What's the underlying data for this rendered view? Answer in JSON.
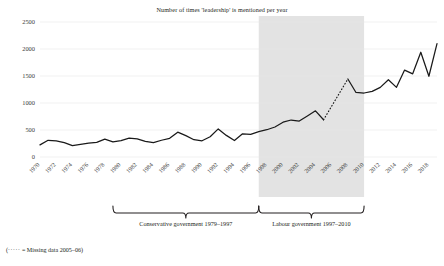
{
  "chart_data": {
    "type": "line",
    "title": "Number of times 'leadership' is mentioned per year",
    "xlabel": "",
    "ylabel": "",
    "ylim": [
      0,
      2500
    ],
    "yticks": [
      0,
      500,
      1000,
      1500,
      2000,
      2500
    ],
    "xlim": [
      1970,
      2019
    ],
    "xticks": [
      1970,
      1972,
      1974,
      1976,
      1978,
      1980,
      1982,
      1984,
      1986,
      1988,
      1990,
      1992,
      1994,
      1996,
      1998,
      2000,
      2002,
      2004,
      2006,
      2008,
      2010,
      2012,
      2014,
      2016,
      2018
    ],
    "grid": true,
    "legend": "none",
    "x": [
      1970,
      1971,
      1972,
      1973,
      1974,
      1975,
      1976,
      1977,
      1978,
      1979,
      1980,
      1981,
      1982,
      1983,
      1984,
      1985,
      1986,
      1987,
      1988,
      1989,
      1990,
      1991,
      1992,
      1993,
      1994,
      1995,
      1996,
      1997,
      1998,
      1999,
      2000,
      2001,
      2002,
      2003,
      2004,
      2005,
      2006,
      2007,
      2008,
      2009,
      2010,
      2011,
      2012,
      2013,
      2014,
      2015,
      2016,
      2017,
      2018,
      2019
    ],
    "values": [
      225,
      310,
      300,
      265,
      210,
      235,
      255,
      270,
      330,
      280,
      305,
      350,
      335,
      290,
      265,
      310,
      345,
      460,
      395,
      320,
      300,
      375,
      520,
      400,
      305,
      430,
      420,
      470,
      505,
      555,
      645,
      685,
      665,
      760,
      855,
      690,
      null,
      null,
      1445,
      1195,
      1185,
      1215,
      1290,
      1430,
      1290,
      1610,
      1540,
      1940,
      1495,
      2100
    ],
    "series": [
      {
        "name": "Mentions of 'leadership'",
        "values": [
          225,
          310,
          300,
          265,
          210,
          235,
          255,
          270,
          330,
          280,
          305,
          350,
          335,
          290,
          265,
          310,
          345,
          460,
          395,
          320,
          300,
          375,
          520,
          400,
          305,
          430,
          420,
          470,
          505,
          555,
          645,
          685,
          665,
          760,
          855,
          690,
          null,
          null,
          1445,
          1195,
          1185,
          1215,
          1290,
          1430,
          1290,
          1610,
          1540,
          1940,
          1495,
          2100
        ]
      }
    ],
    "missing_data_segment": {
      "style": "dotted",
      "from_year": 2005,
      "to_year": 2008,
      "label": "Missing data 2005–06"
    },
    "shaded_region": {
      "from_year": 1997,
      "to_year": 2010,
      "color": "#e3e3e3",
      "meaning": "Labour government"
    },
    "annotations": [
      {
        "name": "conservative-bracket",
        "label": "Conservative government 1979–1997",
        "from_year": 1979,
        "to_year": 1997
      },
      {
        "name": "labour-bracket",
        "label": "Labour government 1997–2010",
        "from_year": 1997,
        "to_year": 2010
      }
    ],
    "footnote": "(····· = Missing data 2005–06)"
  },
  "colors": {
    "line": "#1a1a1a",
    "grid": "#e8e8e8",
    "shade": "#e3e3e3",
    "text": "#231f20"
  },
  "footnote_prefix": "(",
  "footnote_dots": "·····",
  "footnote_rest": " = Missing data 2005–06)"
}
